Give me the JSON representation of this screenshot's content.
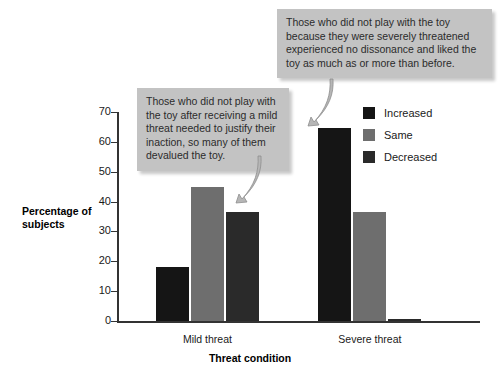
{
  "chart_data": {
    "type": "bar",
    "title": "",
    "xlabel": "Threat condition",
    "ylabel": "Percentage of subjects",
    "ylim": [
      0,
      70
    ],
    "yticks": [
      0,
      10,
      20,
      30,
      40,
      50,
      60,
      70
    ],
    "grid": false,
    "legend_position": "right",
    "categories": [
      "Mild threat",
      "Severe threat"
    ],
    "series": [
      {
        "name": "Increased",
        "color": "#151515",
        "values": [
          18,
          64.5
        ]
      },
      {
        "name": "Same",
        "color": "#6e6e6e",
        "values": [
          45,
          36.5
        ]
      },
      {
        "name": "Decreased",
        "color": "#2a2a2a",
        "values": [
          36.5,
          0.7
        ]
      }
    ],
    "annotations": [
      {
        "id": "callout-mild",
        "text": "Those who did not play with the toy after receiving a mild threat needed to justify their inaction, so many of them devalued the toy.",
        "points_to": "Mild threat / Decreased bar"
      },
      {
        "id": "callout-severe",
        "text": "Those who did not play with the toy because they were severely threatened experienced no dissonance and liked the toy as much as or more than before.",
        "points_to": "Severe threat / Increased bar"
      }
    ]
  },
  "axis": {
    "y_label_line1": "Percentage of",
    "y_label_line2": "subjects",
    "x_title": "Threat condition",
    "tick_labels": [
      "0",
      "10",
      "20",
      "30",
      "40",
      "50",
      "60",
      "70"
    ]
  },
  "legend": {
    "items": [
      {
        "label": "Increased",
        "color": "#151515"
      },
      {
        "label": "Same",
        "color": "#6e6e6e"
      },
      {
        "label": "Decreased",
        "color": "#2a2a2a"
      }
    ]
  },
  "colors": {
    "background": "#ffffff",
    "axis": "#333333",
    "callout_bg": "#c3c3c3",
    "callout_text": "#2b2b2b",
    "increased": "#151515",
    "same": "#6e6e6e",
    "decreased": "#2a2a2a"
  }
}
